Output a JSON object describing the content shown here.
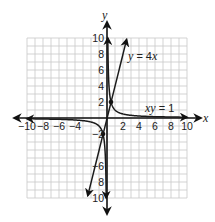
{
  "chart_data": {
    "type": "line",
    "title": "",
    "xlabel": "x",
    "ylabel": "y",
    "xlim": [
      -10,
      10
    ],
    "ylim": [
      -10,
      10
    ],
    "grid": true,
    "grid_step": 1,
    "x_tick_labels": [
      "−10",
      "−8",
      "−6",
      "−4",
      "2",
      "4",
      "6",
      "8",
      "10"
    ],
    "x_tick_values": [
      -10,
      -8,
      -6,
      -4,
      2,
      4,
      6,
      8,
      10
    ],
    "y_tick_labels": [
      "10",
      "8",
      "6",
      "4",
      "2",
      "−2",
      "−6",
      "8",
      "10"
    ],
    "y_tick_values": [
      10,
      8,
      6,
      4,
      2,
      -2,
      -6,
      -8,
      -10
    ],
    "series": [
      {
        "name": "y = 4x",
        "equation": "y = 4x",
        "kind": "line",
        "x": [
          -2.4,
          2.45
        ],
        "y": [
          -9.7,
          9.8
        ],
        "arrows": "both"
      },
      {
        "name": "xy = 1",
        "equation": "xy = 1",
        "kind": "hyperbola",
        "branches": [
          {
            "x_range": [
              0.1,
              10
            ],
            "arrows": "both"
          },
          {
            "x_range": [
              -10,
              -0.1
            ],
            "arrows": "both"
          }
        ]
      }
    ],
    "intersection_points": [
      {
        "x": 0.5,
        "y": 2
      },
      {
        "x": -0.5,
        "y": -2
      }
    ],
    "annotations": [
      {
        "text_parts": [
          "y",
          " = 4",
          "x"
        ],
        "x": 2.8,
        "y": 7.6
      },
      {
        "text_parts": [
          "xy",
          " = 1"
        ],
        "x": 4.7,
        "y": 1
      }
    ]
  },
  "labels": {
    "x_axis": "x",
    "y_axis": "y",
    "eq1_var1": "y",
    "eq1_mid": " = 4",
    "eq1_var2": "x",
    "eq2_var": "xy",
    "eq2_rest": " = 1"
  },
  "colors": {
    "grid": "#c8c8c8",
    "curve": "#1a1a1a",
    "axis": "#111111"
  }
}
